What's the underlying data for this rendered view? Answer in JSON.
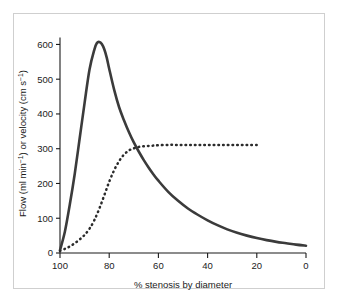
{
  "chart_data": {
    "type": "line",
    "title": "",
    "xlabel": "% stenosis by diameter",
    "ylabel": "Flow (ml min⁻¹) or velocity (cm s⁻¹)",
    "ylabel_parts": {
      "p1": "Flow (ml min",
      "sup1": "−1",
      "p2": ") or velocity (cm s",
      "sup2": "−1",
      "p3": ")"
    },
    "xlim": [
      100,
      0
    ],
    "ylim": [
      0,
      630
    ],
    "x_reversed": true,
    "grid": false,
    "legend": "none",
    "xticks": [
      100,
      80,
      60,
      40,
      20,
      0
    ],
    "xtick_labels": [
      "100",
      "80",
      "60",
      "40",
      "20",
      "0"
    ],
    "yticks": [
      0,
      100,
      200,
      300,
      400,
      500,
      600
    ],
    "ytick_labels": [
      "0",
      "100",
      "200",
      "300",
      "400",
      "500",
      "600"
    ],
    "series": [
      {
        "name": "flow",
        "style": "solid",
        "color": "#3b3b3b",
        "x": [
          100,
          98,
          96,
          94,
          92,
          90,
          88,
          86,
          85,
          84,
          83,
          82,
          81,
          80,
          78,
          76,
          74,
          72,
          70,
          68,
          66,
          64,
          62,
          60,
          56,
          52,
          48,
          44,
          40,
          36,
          32,
          28,
          24,
          20,
          16,
          12,
          8,
          4,
          0
        ],
        "values": [
          8,
          62,
          140,
          228,
          330,
          432,
          528,
          586,
          604,
          607,
          601,
          586,
          562,
          530,
          470,
          420,
          382,
          348,
          318,
          292,
          268,
          246,
          226,
          208,
          176,
          150,
          128,
          110,
          94,
          80,
          68,
          58,
          50,
          43,
          37,
          32,
          28,
          24,
          21
        ]
      },
      {
        "name": "velocity",
        "style": "dotted",
        "color": "#2b2b2b",
        "x": [
          100,
          98,
          96,
          94,
          92,
          90,
          88,
          86,
          84,
          82,
          80,
          78,
          76,
          74,
          72,
          70,
          68,
          66,
          64,
          62,
          60,
          56,
          52,
          48,
          44,
          40,
          36,
          32,
          28,
          24,
          20,
          19
        ],
        "values": [
          6,
          12,
          19,
          28,
          39,
          52,
          70,
          95,
          128,
          166,
          205,
          238,
          264,
          283,
          295,
          301,
          305,
          307,
          308,
          309,
          310,
          311,
          311,
          311,
          311,
          311,
          311,
          311,
          311,
          311,
          311,
          311
        ]
      }
    ]
  }
}
